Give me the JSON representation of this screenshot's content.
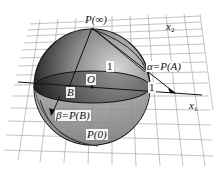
{
  "diagram": {
    "labels": {
      "north_pole": "P(∞)",
      "south_pole": "P(0)",
      "origin": "O",
      "point_b": "B",
      "alpha": "α=P(A)",
      "beta": "β=P(B)",
      "unit_top": "1",
      "unit_right": "1",
      "axis_x1": "x",
      "axis_x1_sub": "1",
      "axis_x2": "x",
      "axis_x2_sub": "2"
    },
    "colors": {
      "sphere_dark": "#1e1e1e",
      "sphere_mid": "#6a6a6a",
      "sphere_light": "#d6d6d6",
      "grid": "#9a9a9a",
      "line": "#111111",
      "background": "#ffffff"
    }
  }
}
